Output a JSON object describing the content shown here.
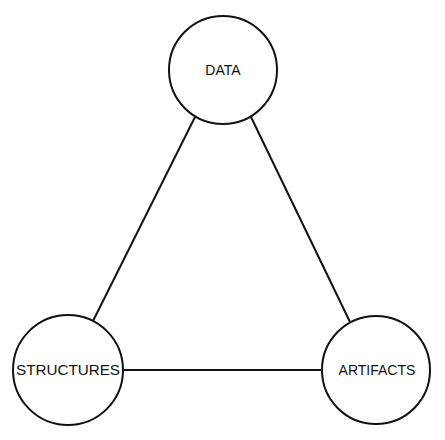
{
  "diagram": {
    "type": "triangle",
    "nodes": [
      {
        "id": "data",
        "label": "DATA",
        "cx": 223,
        "cy": 70,
        "r": 54
      },
      {
        "id": "structures",
        "label": "STRUCTURES",
        "cx": 68,
        "cy": 370,
        "r": 55
      },
      {
        "id": "artifacts",
        "label": "ARTIFACTS",
        "cx": 376,
        "cy": 370,
        "r": 54
      }
    ],
    "edges": [
      {
        "from": "data",
        "to": "structures"
      },
      {
        "from": "data",
        "to": "artifacts"
      },
      {
        "from": "structures",
        "to": "artifacts"
      }
    ],
    "stroke_color": "#111111"
  }
}
